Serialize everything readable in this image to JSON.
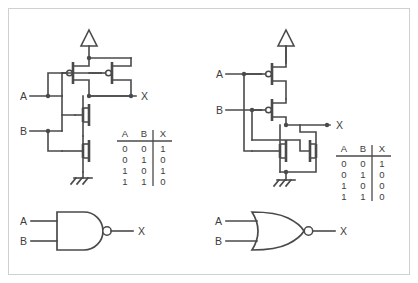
{
  "figure": {
    "background_color": "#ffffff",
    "border_color": "#d0d0d0",
    "ink_color": "#4a4a4a",
    "text_color": "#3d3d3d"
  },
  "left_circuit": {
    "name": "cmos-nand-transistor-schematic",
    "input_a_label": "A",
    "input_b_label": "B",
    "output_label": "X",
    "supply_symbol": "vdd-triangle",
    "ground_symbol": "ground-hatched",
    "pmos_count": 2,
    "nmos_count": 2,
    "pmos_topology": "parallel",
    "nmos_topology": "series"
  },
  "left_table": {
    "headers": [
      "A",
      "B",
      "X"
    ],
    "rows": [
      [
        "0",
        "0",
        "1"
      ],
      [
        "0",
        "1",
        "0"
      ],
      [
        "1",
        "0",
        "1"
      ],
      [
        "1",
        "1",
        "0"
      ]
    ]
  },
  "left_gate": {
    "name": "nand-gate-symbol",
    "input_a_label": "A",
    "input_b_label": "B",
    "output_label": "X",
    "shape": "and-d-shape-with-bubble"
  },
  "right_circuit": {
    "name": "cmos-nor-transistor-schematic",
    "input_a_label": "A",
    "input_b_label": "B",
    "output_label": "X",
    "supply_symbol": "vdd-triangle",
    "ground_symbol": "ground-hatched",
    "pmos_count": 2,
    "nmos_count": 2,
    "pmos_topology": "series",
    "nmos_topology": "parallel"
  },
  "right_table": {
    "headers": [
      "A",
      "B",
      "X"
    ],
    "rows": [
      [
        "0",
        "0",
        "1"
      ],
      [
        "0",
        "1",
        "0"
      ],
      [
        "1",
        "0",
        "0"
      ],
      [
        "1",
        "1",
        "0"
      ]
    ]
  },
  "right_gate": {
    "name": "nor-gate-symbol",
    "input_a_label": "A",
    "input_b_label": "B",
    "output_label": "X",
    "shape": "or-curved-shape-with-bubble"
  }
}
